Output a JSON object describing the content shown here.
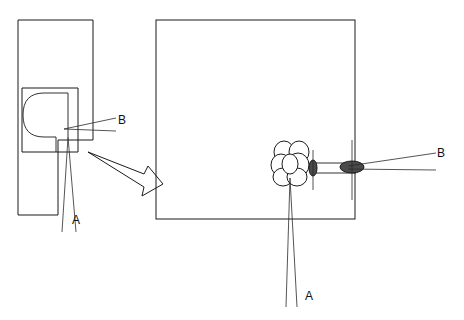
{
  "figure": {
    "background_color": "#ffffff",
    "line_color": "#1b1b1b",
    "fill_color_dark": "#4a4a4a",
    "fill_color_light": "#ffffff",
    "width": 464,
    "height": 320
  },
  "labels": {
    "left_view_a": "A",
    "left_view_b": "B",
    "right_view_a": "A",
    "right_view_b": "B"
  },
  "left_view": {
    "name": "side-elevation-view",
    "outer_body": {
      "x": 18,
      "y": 20,
      "width": 75,
      "height": 120
    },
    "lower_body": {
      "x": 18,
      "y": 140,
      "width": 40,
      "height": 75
    },
    "inner_chamber": {
      "x": 22,
      "y": 88,
      "width": 56,
      "height": 64
    },
    "d_shape_note": "rounded U/D profile opening to the right inside the inner chamber"
  },
  "right_view": {
    "name": "enlarged-detail-view",
    "frame": {
      "x": 156,
      "y": 20,
      "width": 199,
      "height": 199
    },
    "cluster": {
      "name": "bubble-cluster",
      "center_x": 290,
      "center_y": 162,
      "bubble_count": 7
    },
    "valve": {
      "name": "dark-valve-ellipse",
      "center_x": 313,
      "center_y": 168
    },
    "plug": {
      "name": "dark-plug-ellipse",
      "center_x": 352,
      "center_y": 167
    }
  },
  "connector": {
    "name": "magnify-arrow",
    "from_x": 88,
    "from_y": 152,
    "to_x": 156,
    "to_y": 192
  }
}
